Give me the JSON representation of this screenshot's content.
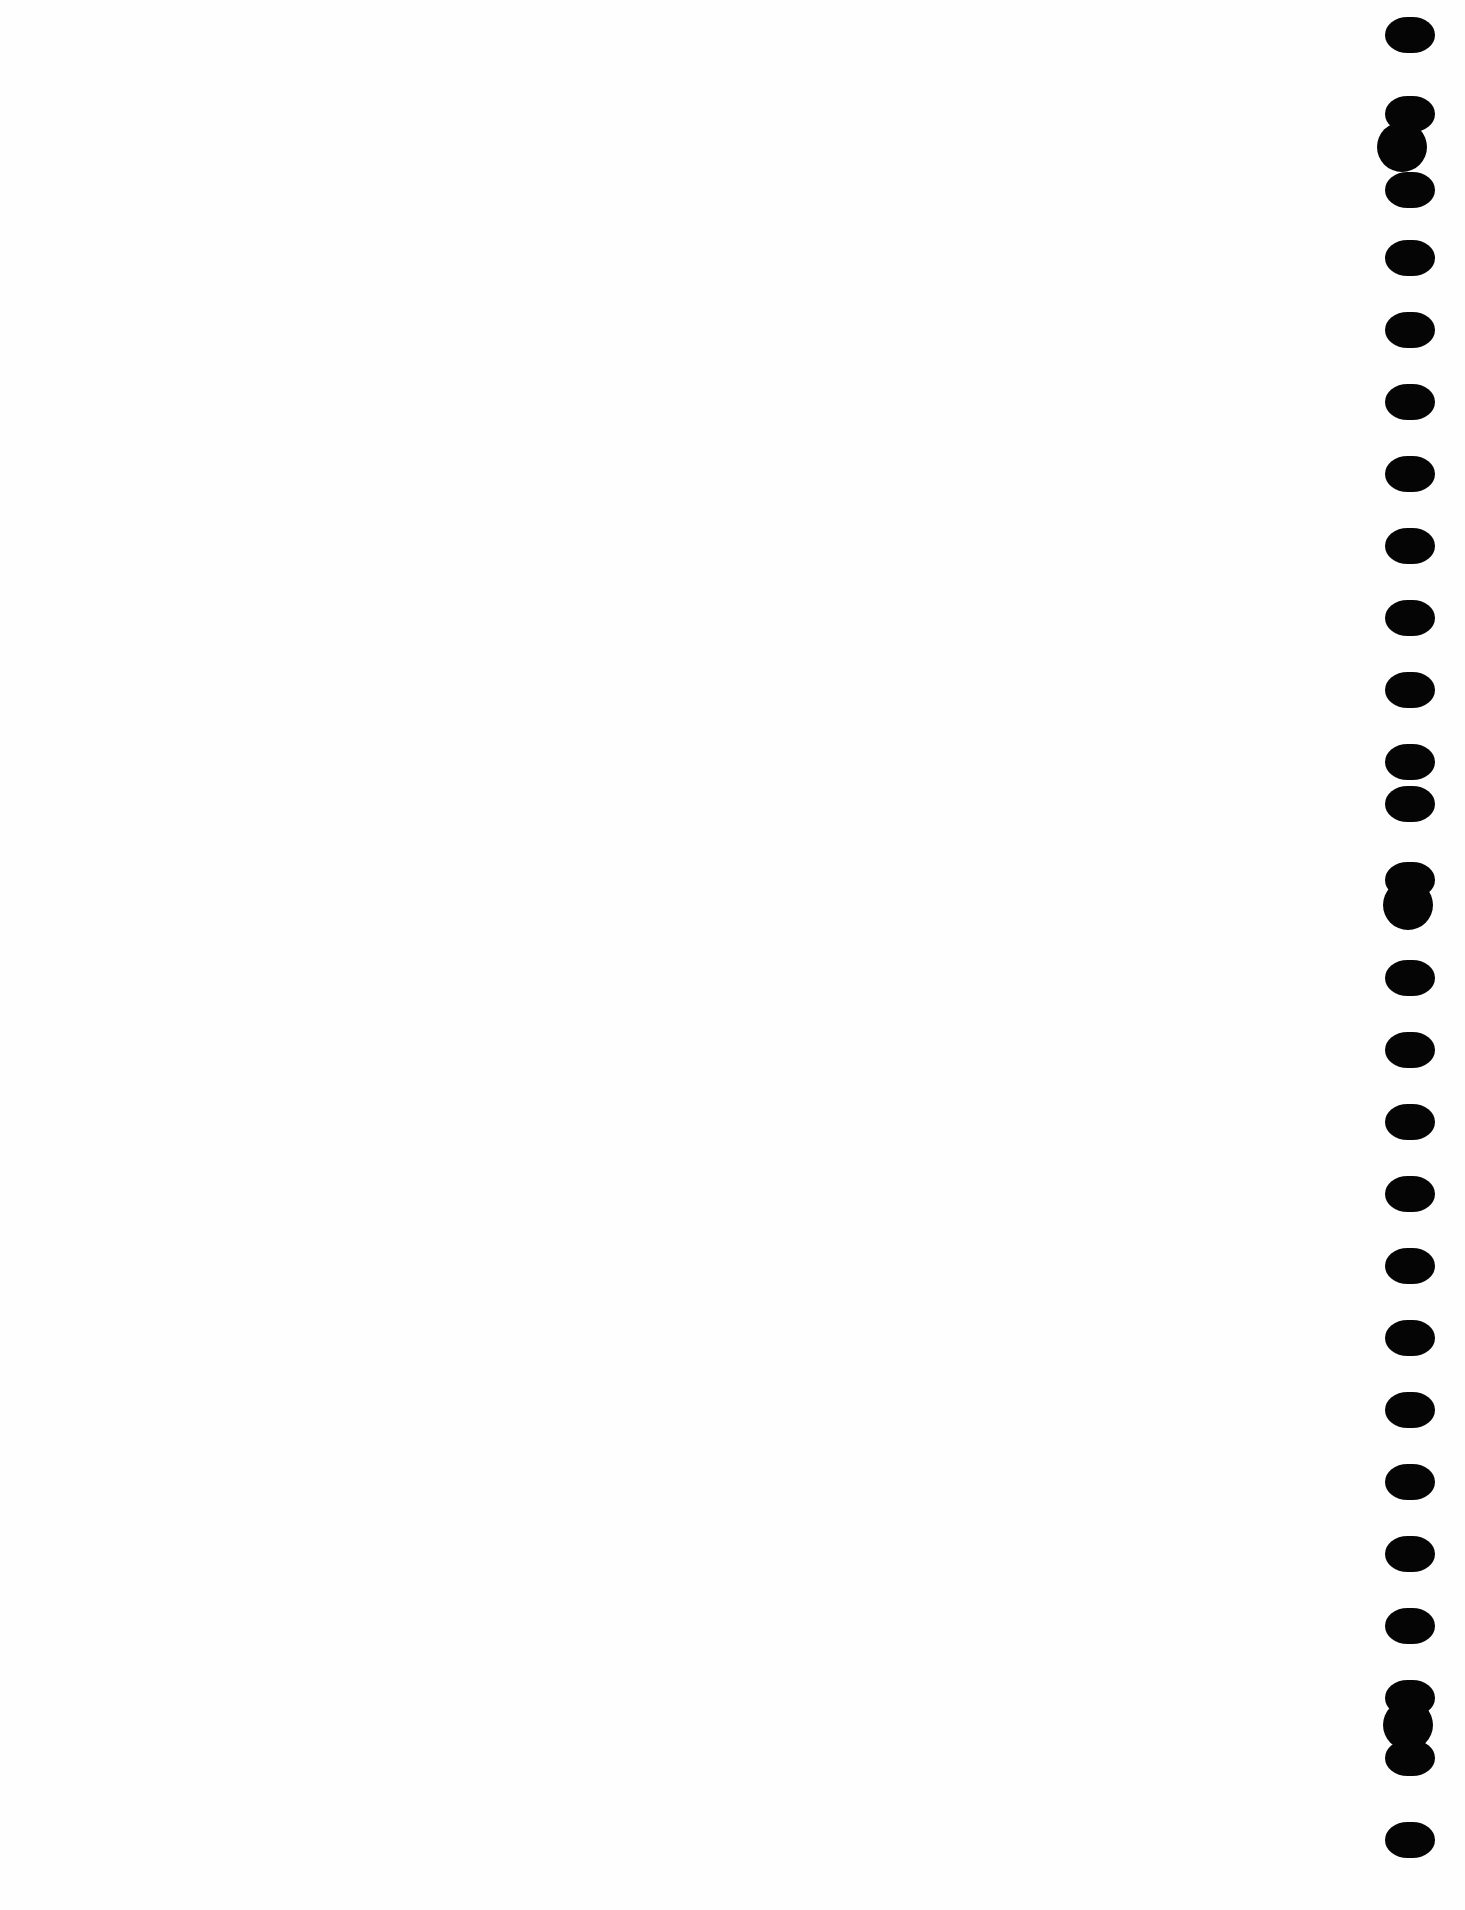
{
  "page": {
    "type": "scanned-blank-page",
    "background": "#fefefe",
    "hole_color": "#050505",
    "holes": [
      {
        "shape": "oval",
        "x": 1385,
        "y": 17
      },
      {
        "shape": "oval",
        "x": 1385,
        "y": 96
      },
      {
        "shape": "round",
        "x": 1377,
        "y": 122
      },
      {
        "shape": "oval",
        "x": 1385,
        "y": 172
      },
      {
        "shape": "oval",
        "x": 1385,
        "y": 240
      },
      {
        "shape": "oval",
        "x": 1385,
        "y": 312
      },
      {
        "shape": "oval",
        "x": 1385,
        "y": 384
      },
      {
        "shape": "oval",
        "x": 1385,
        "y": 456
      },
      {
        "shape": "oval",
        "x": 1385,
        "y": 528
      },
      {
        "shape": "oval",
        "x": 1385,
        "y": 600
      },
      {
        "shape": "oval",
        "x": 1385,
        "y": 672
      },
      {
        "shape": "oval",
        "x": 1385,
        "y": 744
      },
      {
        "shape": "oval",
        "x": 1385,
        "y": 786
      },
      {
        "shape": "oval",
        "x": 1385,
        "y": 862
      },
      {
        "shape": "round",
        "x": 1383,
        "y": 880
      },
      {
        "shape": "oval",
        "x": 1385,
        "y": 960
      },
      {
        "shape": "oval",
        "x": 1385,
        "y": 1032
      },
      {
        "shape": "oval",
        "x": 1385,
        "y": 1104
      },
      {
        "shape": "oval",
        "x": 1385,
        "y": 1176
      },
      {
        "shape": "oval",
        "x": 1385,
        "y": 1248
      },
      {
        "shape": "oval",
        "x": 1385,
        "y": 1320
      },
      {
        "shape": "oval",
        "x": 1385,
        "y": 1392
      },
      {
        "shape": "oval",
        "x": 1385,
        "y": 1464
      },
      {
        "shape": "oval",
        "x": 1385,
        "y": 1536
      },
      {
        "shape": "oval",
        "x": 1385,
        "y": 1608
      },
      {
        "shape": "oval",
        "x": 1385,
        "y": 1680
      },
      {
        "shape": "round",
        "x": 1383,
        "y": 1700
      },
      {
        "shape": "oval",
        "x": 1385,
        "y": 1740
      },
      {
        "shape": "oval",
        "x": 1385,
        "y": 1822
      }
    ]
  }
}
